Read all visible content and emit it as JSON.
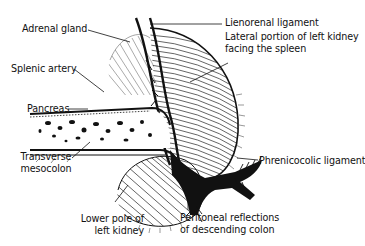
{
  "diagram": {
    "labels": {
      "adrenal_gland": "Adrenal gland",
      "splenic_artery": "Splenic artery",
      "pancreas": "Pancreas",
      "transverse_mesocolon_1": "Transverse",
      "transverse_mesocolon_2": "mesocolon",
      "lower_pole_1": "Lower pole of",
      "lower_pole_2": "left kidney",
      "lienorenal": "Lienorenal ligament",
      "lateral_portion_1": "Lateral portion of left kidney",
      "lateral_portion_2": "facing the spleen",
      "phrenicocolic": "Phrenicocolic ligament",
      "peritoneal_1": "Peritoneal reflections",
      "peritoneal_2": "of descending colon"
    },
    "colors": {
      "ink": "#111111",
      "background": "#ffffff"
    }
  }
}
